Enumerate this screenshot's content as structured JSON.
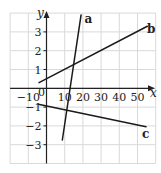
{
  "chart_data": {
    "type": "line",
    "title": "",
    "xlabel": "x",
    "ylabel": "y",
    "xlim": [
      -20,
      60
    ],
    "ylim": [
      -4,
      4
    ],
    "grid": true,
    "x_ticks": [
      -10,
      0,
      10,
      20,
      30,
      40,
      50
    ],
    "x_tick_labels": [
      "−10",
      "0",
      "10",
      "20",
      "30",
      "40",
      "50"
    ],
    "y_ticks": [
      -3,
      -2,
      -1,
      1,
      2,
      3
    ],
    "y_tick_labels": [
      "−3",
      "−2",
      "−1",
      "1",
      "2",
      "3"
    ],
    "legend": null,
    "series": [
      {
        "name": "a",
        "points": [
          [
            8.7,
            -2.75
          ],
          [
            19.0,
            3.9
          ]
        ]
      },
      {
        "name": "b",
        "points": [
          [
            -4.1,
            0.3
          ],
          [
            55.4,
            3.3
          ]
        ]
      },
      {
        "name": "c",
        "points": [
          [
            -4.5,
            -0.85
          ],
          [
            54.7,
            -2.04
          ]
        ]
      }
    ],
    "annotations": [
      {
        "text": "a",
        "x": 23,
        "y": 3.7
      },
      {
        "text": "b",
        "x": 57.5,
        "y": 3.15
      },
      {
        "text": "c",
        "x": 54.5,
        "y": -2.45
      }
    ]
  },
  "colors": {
    "grid": "#d9d9d9",
    "axis": "#222222",
    "line": "#1a1a1a"
  }
}
